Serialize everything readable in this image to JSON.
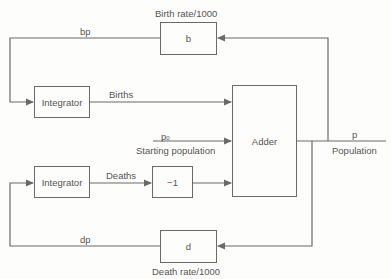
{
  "diagram": {
    "boxes": {
      "birth_rate": "b",
      "death_rate": "d",
      "integrator_births": "Integrator",
      "integrator_deaths": "Integrator",
      "negate": "−1",
      "adder": "Adder"
    },
    "labels": {
      "birth_rate_caption": "Birth rate/1000",
      "death_rate_caption": "Death rate/1000",
      "bp": "bp",
      "dp": "dp",
      "births": "Births",
      "deaths": "Deaths",
      "p0_main": "p",
      "p0_sub": "0",
      "starting_population": "Starting population",
      "p": "p",
      "population": "Population"
    },
    "colors": {
      "line": "#6a6a6a",
      "text": "#555555",
      "background": "#fdfdfb"
    }
  }
}
